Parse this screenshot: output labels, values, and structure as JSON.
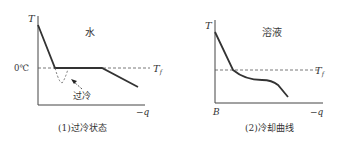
{
  "panel1": {
    "title": "水",
    "y_axis_label": "T",
    "x_axis_label": "−q",
    "level_label": "0℃",
    "freeze_label": "T",
    "freeze_subscript": "f",
    "annotation": "过冷",
    "caption": "(1)过冷状态"
  },
  "panel2": {
    "title": "溶液",
    "y_axis_label": "T",
    "x_axis_label": "−q",
    "origin_label": "B",
    "freeze_label": "T",
    "freeze_subscript": "f",
    "caption": "(2)冷却曲线"
  },
  "colors": {
    "curve": "#333333",
    "axis": "#444444",
    "dashed": "#555555"
  }
}
